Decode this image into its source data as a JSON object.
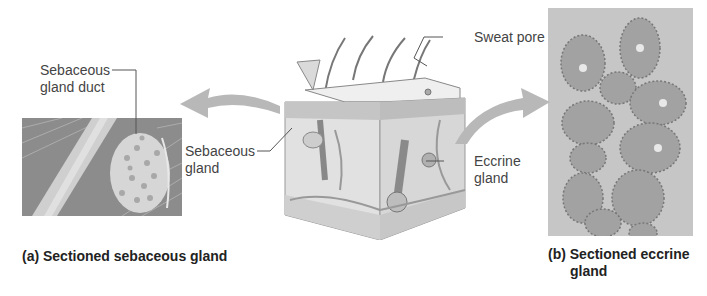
{
  "figure": {
    "labels": {
      "sebaceous_gland_duct": "Sebaceous\ngland duct",
      "sebaceous_gland_duct_line1": "Sebaceous",
      "sebaceous_gland_duct_line2": "gland duct",
      "sebaceous_gland_line1": "Sebaceous",
      "sebaceous_gland_line2": "gland",
      "sweat_pore": "Sweat pore",
      "eccrine_gland_line1": "Eccrine",
      "eccrine_gland_line2": "gland"
    },
    "captions": {
      "a": "(a) Sectioned sebaceous gland",
      "b_line1": "(b) Sectioned eccrine",
      "b_line2": "gland"
    },
    "colors": {
      "arrow": "#b8b8b8",
      "leader_line": "#555555",
      "photo_bg_a": "#9a9a9a",
      "photo_bg_b": "#c8c8c8"
    }
  }
}
